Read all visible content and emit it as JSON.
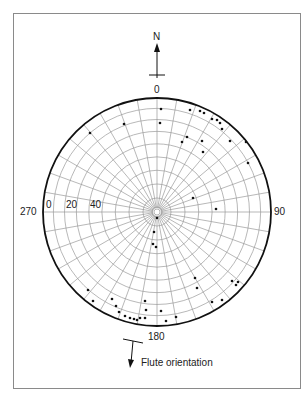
{
  "diagram": {
    "type": "stereonet (polar equal-area net)",
    "north_label": "N",
    "azimuth_labels": {
      "north": "0",
      "east": "90",
      "south": "180",
      "west": "270"
    },
    "radial_labels": [
      "0",
      "20",
      "40"
    ],
    "legend": {
      "symbol": "flute-orientation-arrow",
      "label": "Flute orientation"
    },
    "colors": {
      "grid": "#9a9a9a",
      "outline": "#111111",
      "points": "#111111",
      "frame": "#8a8a8a"
    },
    "geometry": {
      "center_x": 157,
      "center_y": 212,
      "radius": 114
    }
  },
  "chart_data": {
    "type": "scatter",
    "title": "",
    "projection": "polar stereonet",
    "axis_labels": {
      "0": "N / 0",
      "90": "90",
      "180": "180",
      "270": "270"
    },
    "radial_ticks": [
      0,
      20,
      40
    ],
    "legend": [
      "Flute orientation"
    ],
    "grid": true,
    "points_px": [
      [
        161,
        109
      ],
      [
        160,
        123
      ],
      [
        190,
        110
      ],
      [
        200,
        111
      ],
      [
        204,
        113
      ],
      [
        212,
        119
      ],
      [
        217,
        120
      ],
      [
        220,
        123
      ],
      [
        222,
        129
      ],
      [
        187,
        137
      ],
      [
        182,
        142
      ],
      [
        202,
        141
      ],
      [
        230,
        141
      ],
      [
        246,
        142
      ],
      [
        248,
        163
      ],
      [
        203,
        152
      ],
      [
        216,
        209
      ],
      [
        193,
        198
      ],
      [
        90,
        133
      ],
      [
        124,
        124
      ],
      [
        157,
        218
      ],
      [
        154,
        232
      ],
      [
        153,
        244
      ],
      [
        156,
        247
      ],
      [
        88,
        290
      ],
      [
        93,
        301
      ],
      [
        112,
        299
      ],
      [
        116,
        306
      ],
      [
        119,
        312
      ],
      [
        125,
        316
      ],
      [
        130,
        318
      ],
      [
        134,
        319
      ],
      [
        137,
        320
      ],
      [
        140,
        318
      ],
      [
        145,
        301
      ],
      [
        146,
        310
      ],
      [
        145,
        318
      ],
      [
        161,
        311
      ],
      [
        166,
        321
      ],
      [
        176,
        317
      ],
      [
        195,
        278
      ],
      [
        197,
        288
      ],
      [
        212,
        302
      ],
      [
        222,
        300
      ],
      [
        232,
        281
      ],
      [
        236,
        285
      ],
      [
        238,
        282
      ]
    ]
  }
}
